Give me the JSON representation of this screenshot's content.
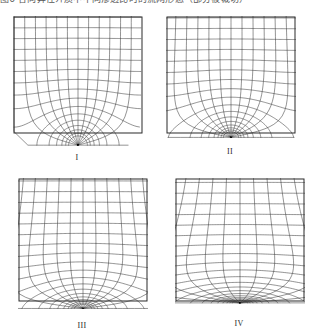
{
  "figure": {
    "top_caption_fragment": "图6  各向异性介质中不同渗透比时的流网形态（部分被裁切）",
    "stroke_color": "#3b3b3b",
    "frame_color": "#2a2a2a",
    "background": "#ffffff"
  },
  "panels": [
    {
      "label": "I",
      "name": "flow-net-panel-1",
      "x": 13,
      "y": 16,
      "w": 128,
      "h": 116,
      "rays": 12,
      "ring_step": 0.2618,
      "rings": 16,
      "sink_x": 0.5,
      "sink_depth": 0.105,
      "spread": 1.0,
      "shear": 0.0,
      "lift": 0.0
    },
    {
      "label": "II",
      "name": "flow-net-panel-2",
      "x": 166,
      "y": 16,
      "w": 128,
      "h": 116,
      "rays": 12,
      "ring_step": 0.2618,
      "rings": 17,
      "sink_x": 0.5,
      "sink_depth": 0.055,
      "spread": 1.22,
      "shear": 0.0,
      "lift": 0.1
    },
    {
      "label": "III",
      "name": "flow-net-panel-3",
      "x": 18,
      "y": 178,
      "w": 128,
      "h": 122,
      "rays": 12,
      "ring_step": 0.2618,
      "rings": 19,
      "sink_x": 0.5,
      "sink_depth": 0.1,
      "spread": 1.75,
      "shear": 0.0,
      "lift": 0.22
    },
    {
      "label": "IV",
      "name": "flow-net-panel-4",
      "x": 175,
      "y": 178,
      "w": 128,
      "h": 122,
      "rays": 12,
      "ring_step": 0.2618,
      "rings": 21,
      "sink_x": 0.5,
      "sink_depth": 0.085,
      "spread": 2.75,
      "shear": 0.0,
      "lift": 0.4
    }
  ],
  "labels": {
    "panel_1": "I",
    "panel_2": "II",
    "panel_3": "III",
    "panel_4": "IV"
  }
}
